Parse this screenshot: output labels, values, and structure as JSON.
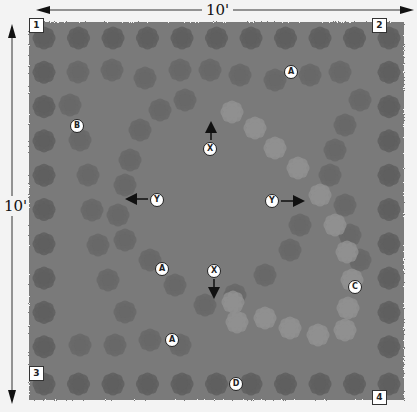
{
  "diagram": {
    "dimensions": {
      "width_label": "10'",
      "height_label": "10'"
    },
    "corners": [
      {
        "id": "1",
        "x": 29,
        "y": 18
      },
      {
        "id": "2",
        "x": 372,
        "y": 18
      },
      {
        "id": "3",
        "x": 29,
        "y": 366
      },
      {
        "id": "4",
        "x": 372,
        "y": 390
      }
    ],
    "markers": [
      {
        "label": "A",
        "x": 284,
        "y": 65
      },
      {
        "label": "A",
        "x": 155,
        "y": 262
      },
      {
        "label": "A",
        "x": 165,
        "y": 333
      },
      {
        "label": "B",
        "x": 70,
        "y": 119
      },
      {
        "label": "C",
        "x": 348,
        "y": 280
      },
      {
        "label": "D",
        "x": 229,
        "y": 377
      },
      {
        "label": "X",
        "x": 203,
        "y": 142
      },
      {
        "label": "X",
        "x": 207,
        "y": 264
      },
      {
        "label": "Y",
        "x": 150,
        "y": 193
      },
      {
        "label": "Y",
        "x": 265,
        "y": 194
      }
    ],
    "arrows": [
      {
        "name": "x-up-arrow",
        "x1": 211,
        "y1": 140,
        "x2": 211,
        "y2": 124
      },
      {
        "name": "x-down-arrow",
        "x1": 214,
        "y1": 279,
        "x2": 214,
        "y2": 296
      },
      {
        "name": "y-left-arrow",
        "x1": 148,
        "y1": 199,
        "x2": 128,
        "y2": 199
      },
      {
        "name": "y-right-arrow",
        "x1": 281,
        "y1": 201,
        "x2": 302,
        "y2": 201
      }
    ],
    "colors": {
      "bed": "#7a7a7a",
      "border_plant": "#5f5f5f",
      "ring_plant_dark": "#686868",
      "ring_plant_light": "#909090",
      "marker_fill": "#ffffff",
      "background": "#f3f3f3"
    },
    "legend": {
      "A": "outer oval ring plants",
      "B": "outer border row plants",
      "C": "inner light ring plants",
      "D": "bottom edge row plants",
      "X": "vertical measurement",
      "Y": "horizontal measurement"
    }
  }
}
